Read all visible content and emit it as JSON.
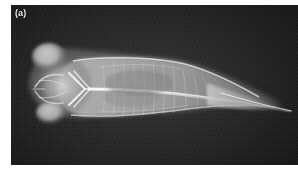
{
  "figure": {
    "panel_label": "(a)",
    "modality_name": "x-ray-radiograph",
    "subject_name": "fish-specimen-dorsal-view",
    "caption_text": "",
    "colors": {
      "page_background": "#ffffff",
      "plate_background": "#1b1b1b",
      "plate_background_dark": "#141414",
      "specimen_bright": "#f2f2f2",
      "specimen_mid": "#a8a8a8",
      "specimen_dim": "#6f6f6f",
      "label_text": "#e9e9e9"
    },
    "plate": {
      "left": 11,
      "top": 5,
      "width": 287,
      "height": 160
    },
    "specimen": {
      "orientation": "head-left-tail-right",
      "anatomy": [
        {
          "name": "left-eye-capsule",
          "label": "eye"
        },
        {
          "name": "right-eye-capsule",
          "label": "eye"
        },
        {
          "name": "cranium",
          "label": "skull"
        },
        {
          "name": "pectoral-girdle",
          "label": "cleithrum"
        },
        {
          "name": "vertebral-column",
          "label": "spine"
        },
        {
          "name": "trunk-musculature",
          "label": "trunk"
        },
        {
          "name": "swim-bladder",
          "label": "swim bladder"
        },
        {
          "name": "caudal-peduncle",
          "label": "tail"
        },
        {
          "name": "caudal-fin-ray",
          "label": "caudal fin"
        }
      ]
    }
  }
}
